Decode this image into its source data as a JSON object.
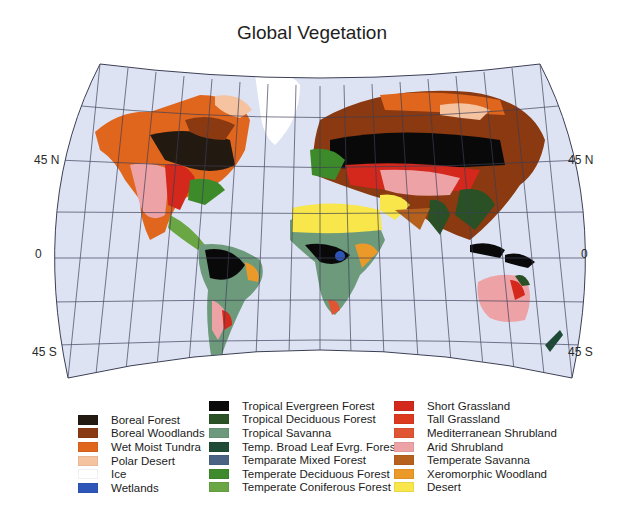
{
  "title": "Global Vegetation",
  "lat_labels": {
    "left": [
      {
        "text": "45 N",
        "x": 34,
        "y": 160
      },
      {
        "text": "0",
        "x": 35,
        "y": 254
      },
      {
        "text": "45 S",
        "x": 32,
        "y": 343
      }
    ],
    "right": [
      {
        "text": "45 N",
        "x": 568,
        "y": 160
      },
      {
        "text": "0",
        "x": 581,
        "y": 254
      },
      {
        "text": "45 S",
        "x": 568,
        "y": 343
      }
    ]
  },
  "map": {
    "ocean_color": "#dde3f3",
    "grid_color": "#3c3f55",
    "projection_outline": "curved interrupted-free world projection"
  },
  "legend": {
    "columns": [
      {
        "items": [
          {
            "label": "Boreal Forest",
            "color": "#231a12"
          },
          {
            "label": "Boreal Woodlands",
            "color": "#8a3a12"
          },
          {
            "label": "Wet Moist Tundra",
            "color": "#e0661e"
          },
          {
            "label": "Polar Desert",
            "color": "#f6c3a0"
          },
          {
            "label": "Ice",
            "color": "#ffffff"
          },
          {
            "label": "Wetlands",
            "color": "#2e55b8"
          }
        ]
      },
      {
        "items": [
          {
            "label": "Tropical Evergreen Forest",
            "color": "#0a0a0a"
          },
          {
            "label": "Tropical Deciduous Forest",
            "color": "#2a5226"
          },
          {
            "label": "Tropical Savanna",
            "color": "#6d9a7c"
          },
          {
            "label": "Temp. Broad Leaf Evrg. Forest",
            "color": "#1e4a36"
          },
          {
            "label": "Temparate Mixed Forest",
            "color": "#4a6284"
          },
          {
            "label": "Temperate Deciduous Forest",
            "color": "#3e8a2c"
          },
          {
            "label": "Temperate Coniferous Forest",
            "color": "#6aa644"
          }
        ]
      },
      {
        "items": [
          {
            "label": "Short Grassland",
            "color": "#d3281c"
          },
          {
            "label": "Tall Grassland",
            "color": "#dc3a1e"
          },
          {
            "label": "Mediterranean Shrubland",
            "color": "#e05634"
          },
          {
            "label": "Arid Shrubland",
            "color": "#eda3a6"
          },
          {
            "label": "Temperate Savanna",
            "color": "#b6621e"
          },
          {
            "label": "Xeromorphic Woodland",
            "color": "#eb9a2a"
          },
          {
            "label": "Desert",
            "color": "#f8e64a"
          }
        ]
      }
    ]
  }
}
